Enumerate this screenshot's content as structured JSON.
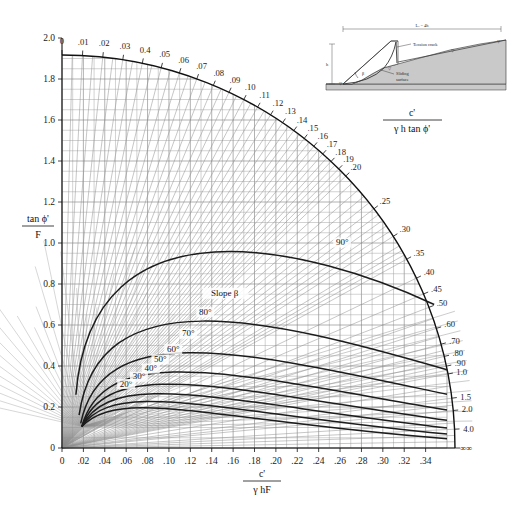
{
  "figure": {
    "kind": "slope-stability-design-chart",
    "title": ""
  },
  "chart_data": {
    "type": "line",
    "title": "",
    "xlabel": "c' / γ hF",
    "ylabel": "tan ϕ' / F",
    "xlim": [
      0,
      0.36
    ],
    "ylim": [
      0,
      2.0
    ],
    "grid": true,
    "legend": "inline-curve-labels",
    "x_ticks": [
      "0",
      ".02",
      ".04",
      ".06",
      ".08",
      ".10",
      ".12",
      ".14",
      ".16",
      ".18",
      ".20",
      ".22",
      ".24",
      ".26",
      ".28",
      ".30",
      ".32",
      ".34"
    ],
    "x_tick_values": [
      0,
      0.02,
      0.04,
      0.06,
      0.08,
      0.1,
      0.12,
      0.14,
      0.16,
      0.18,
      0.2,
      0.22,
      0.24,
      0.26,
      0.28,
      0.3,
      0.32,
      0.34
    ],
    "x_end_symbol": "∞",
    "y_ticks": [
      "0",
      "0.2",
      "0.4",
      "0.6",
      "0.8",
      "1.0",
      "1.2",
      "1.4",
      "1.6",
      "1.8",
      "2.0"
    ],
    "y_tick_values": [
      0,
      0.2,
      0.4,
      0.6,
      0.8,
      1.0,
      1.2,
      1.4,
      1.6,
      1.8,
      2.0
    ],
    "radial_axis": {
      "label": "c' / γ h tan ϕ'",
      "labels_top": [
        "0",
        ".01",
        ".02",
        ".03",
        "0.4",
        ".05",
        ".06",
        ".07",
        ".08",
        ".09",
        ".10",
        ".11",
        ".12",
        ".13",
        ".14",
        ".15",
        ".16",
        ".17",
        ".18",
        ".19",
        ".20"
      ],
      "labels_right": [
        ".25",
        ".30",
        ".35",
        ".40",
        ".45",
        ".50",
        ".60",
        ".70",
        ".80",
        ".90",
        "1.0",
        "1.5",
        "2.0",
        "4.0",
        "∞"
      ],
      "values_top": [
        0,
        0.01,
        0.02,
        0.03,
        0.04,
        0.05,
        0.06,
        0.07,
        0.08,
        0.09,
        0.1,
        0.11,
        0.12,
        0.13,
        0.14,
        0.15,
        0.16,
        0.17,
        0.18,
        0.19,
        0.2
      ],
      "values_right": [
        0.25,
        0.3,
        0.35,
        0.4,
        0.45,
        0.5,
        0.6,
        0.7,
        0.8,
        0.9,
        1.0,
        1.5,
        2.0,
        4.0,
        1000
      ]
    },
    "series": [
      {
        "name": "20°",
        "label": "20°",
        "beta_deg": 20
      },
      {
        "name": "30°",
        "label": "30°",
        "beta_deg": 30
      },
      {
        "name": "40°",
        "label": "40°",
        "beta_deg": 40
      },
      {
        "name": "50°",
        "label": "50°",
        "beta_deg": 50
      },
      {
        "name": "60°",
        "label": "60°",
        "beta_deg": 60
      },
      {
        "name": "70°",
        "label": "70°",
        "beta_deg": 70
      },
      {
        "name": "80°",
        "label": "80°",
        "beta_deg": 80
      },
      {
        "name": "90°",
        "label": "90°",
        "beta_deg": 90
      }
    ],
    "annotations": [
      {
        "text": "Slope β",
        "x": 0.152,
        "y": 0.74
      },
      {
        "text": "90°",
        "x": 0.262,
        "y": 0.99
      }
    ]
  },
  "y_axis": {
    "numerator": "tan ϕ'",
    "denominator": "F"
  },
  "x_axis": {
    "numerator": "c'",
    "denominator": "γ hF"
  },
  "radial_axis_label": {
    "numerator": "c'",
    "denominator": "γ h  tan ϕ'"
  },
  "curve_labels": [
    "20°",
    "30°",
    "40°",
    "50°",
    "60°",
    "70°",
    "80°",
    "90°"
  ],
  "slope_beta_label": "Slope β",
  "inset": {
    "dimension_label": "Lᵥ = 4h",
    "height_label": "h",
    "beta_label": "β",
    "tension_crack_label": "Tension crack",
    "sliding_surface_label": "Sliding\nsurface",
    "sliding_surface_line1": "Sliding",
    "sliding_surface_line2": "surface",
    "water_table_symbol": "▽",
    "fill_color": "#c9c9c9",
    "line_color": "#333333"
  },
  "colors": {
    "background": "#ffffff",
    "grid_minor": "#9a9a9a",
    "grid_major": "#7d7d7d",
    "curve": "#1c1c1c",
    "axis": "#111111",
    "inset_fill": "#c9c9c9"
  }
}
